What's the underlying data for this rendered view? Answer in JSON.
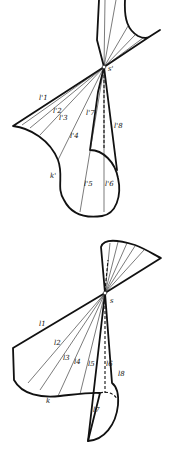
{
  "figures": [
    {
      "name": "upper-cone",
      "vertex_label": "s'",
      "curve_label": "k'",
      "generator_labels": [
        "l'1",
        "l'2",
        "l'3",
        "l'4",
        "l'5",
        "l'6",
        "l'7",
        "l'8"
      ]
    },
    {
      "name": "lower-cone",
      "vertex_label": "s",
      "curve_label": "k",
      "generator_labels": [
        "l1",
        "l2",
        "l3",
        "l4",
        "l5",
        "l6",
        "l7",
        "l8"
      ]
    }
  ],
  "colors": {
    "line": "#111111",
    "background": "#ffffff"
  }
}
